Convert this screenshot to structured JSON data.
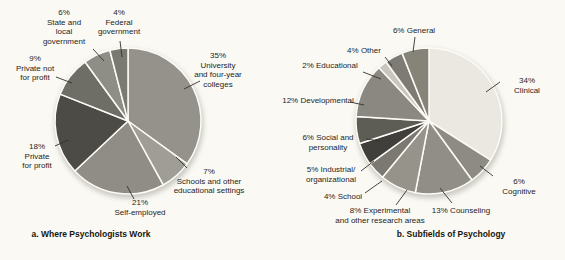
{
  "page": {
    "background": "#faf9f4",
    "text_color": "#26251f",
    "separator_color": "#fcfbf6",
    "leader_line_color": "#33312c"
  },
  "chart_data": [
    {
      "type": "pie",
      "title": "a. Where Psychologists Work",
      "start_angle_deg": 0,
      "direction": "clockwise",
      "slices": [
        {
          "label": "University and four-year colleges",
          "pct": 35,
          "color": "#94928a",
          "display": "35%\nUniversity\nand four-year\ncolleges"
        },
        {
          "label": "Schools and other educational settings",
          "pct": 7,
          "color": "#9f9d96",
          "display": "7%\nSchools and other\neducational settings"
        },
        {
          "label": "Self-employed",
          "pct": 21,
          "color": "#8f8d85",
          "display": "21%\nSelf-employed"
        },
        {
          "label": "Private for profit",
          "pct": 18,
          "color": "#4c4b46",
          "display": "18%\nPrivate\nfor profit"
        },
        {
          "label": "Private not for profit",
          "pct": 9,
          "color": "#6e6d66",
          "display": "9%\nPrivate not\nfor profit"
        },
        {
          "label": "State and local government",
          "pct": 6,
          "color": "#8f8e86",
          "display": "6%\nState and\nlocal\ngovernment"
        },
        {
          "label": "Federal government",
          "pct": 4,
          "color": "#7b7a72",
          "display": "4%\nFederal\ngovernment"
        }
      ]
    },
    {
      "type": "pie",
      "title": "b. Subfields of Psychology",
      "start_angle_deg": 0,
      "direction": "clockwise",
      "slices": [
        {
          "label": "Clinical",
          "pct": 34,
          "color": "#eae8e0",
          "display": "34% Clinical"
        },
        {
          "label": "Cognitive",
          "pct": 6,
          "color": "#8d8b83",
          "display": "6% Cognitive"
        },
        {
          "label": "Counseling",
          "pct": 13,
          "color": "#908e86",
          "display": "13% Counseling"
        },
        {
          "label": "Experimental and other research areas",
          "pct": 8,
          "color": "#95938a",
          "display": "8% Experimental\nand other research areas"
        },
        {
          "label": "School",
          "pct": 4,
          "color": "#7b7971",
          "display": "4% School"
        },
        {
          "label": "Industrial/organizational",
          "pct": 5,
          "color": "#403f3b",
          "display": "5% Industrial/\norganizational"
        },
        {
          "label": "Social and personality",
          "pct": 6,
          "color": "#5d5c55",
          "display": "6% Social and\npersonality"
        },
        {
          "label": "Developmental",
          "pct": 12,
          "color": "#8a8880",
          "display": "12% Developmental"
        },
        {
          "label": "Educational",
          "pct": 2,
          "color": "#c9c7bd",
          "display": "2% Educational"
        },
        {
          "label": "Other",
          "pct": 4,
          "color": "#7d7b73",
          "display": "4% Other"
        },
        {
          "label": "General",
          "pct": 6,
          "color": "#868479",
          "display": "6% General"
        }
      ]
    }
  ]
}
